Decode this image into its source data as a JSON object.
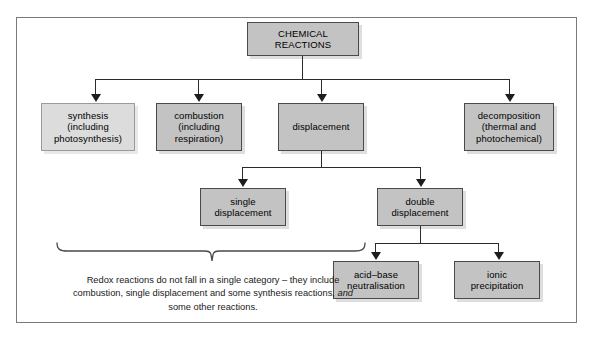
{
  "diagram": {
    "title_box": {
      "label": "CHEMICAL\nREACTIONS",
      "line1": "CHEMICAL",
      "line2": "REACTIONS"
    },
    "level1": [
      {
        "id": "synthesis",
        "line1": "synthesis",
        "line2": "(including",
        "line3": "photosynthesis)",
        "style": "light"
      },
      {
        "id": "combustion",
        "line1": "combustion",
        "line2": "(including",
        "line3": "respiration)",
        "style": "normal"
      },
      {
        "id": "displacement",
        "line1": "displacement",
        "line2": "",
        "line3": "",
        "style": "normal"
      },
      {
        "id": "decomposition",
        "line1": "decomposition",
        "line2": "(thermal and",
        "line3": "photochemical)",
        "style": "normal"
      }
    ],
    "level2": [
      {
        "id": "single-displacement",
        "line1": "single",
        "line2": "displacement"
      },
      {
        "id": "double-displacement",
        "line1": "double",
        "line2": "displacement"
      }
    ],
    "level3": [
      {
        "id": "acid-base-neutralisation",
        "line1": "acid–base",
        "line2": "neutralisation"
      },
      {
        "id": "ionic-precipitation",
        "line1": "ionic",
        "line2": "precipitation"
      }
    ],
    "caption": {
      "part1": "Redox reactions do not fall in a single category – they include combustion, single displacement and some synthesis reactions, ",
      "emphasis": "and",
      "part2": " some other reactions."
    },
    "colors": {
      "box_fill": "#c3c3c3",
      "box_fill_light": "#dcdcdc",
      "box_border": "#6a6a6a",
      "connector": "#2b2b2b",
      "frame_border": "#7a7a7a",
      "text": "#000000"
    }
  }
}
